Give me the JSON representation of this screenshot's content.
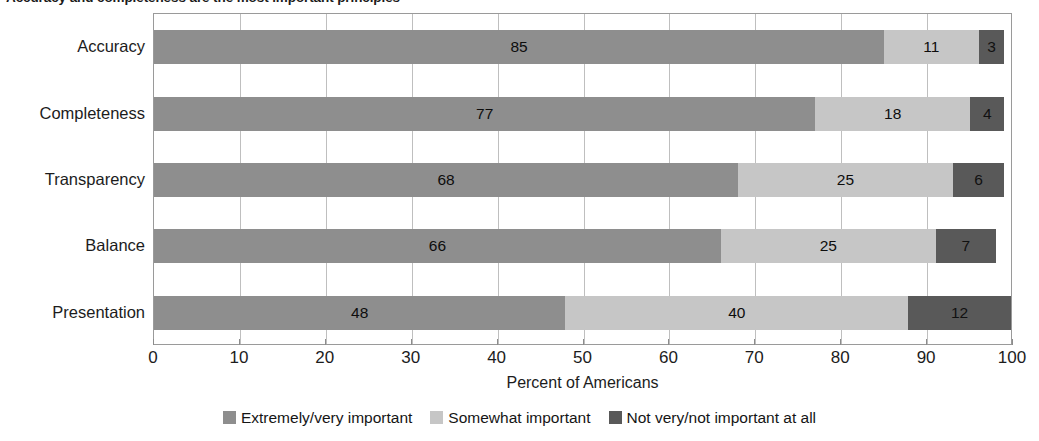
{
  "title": "Accuracy and completeness are the most important principles",
  "chart_data": {
    "type": "bar",
    "orientation": "horizontal",
    "stacked": true,
    "title": "Accuracy and completeness are the most important principles",
    "xlabel": "Percent of Americans",
    "ylabel": "",
    "xlim": [
      0,
      100
    ],
    "xticks": [
      0,
      10,
      20,
      30,
      40,
      50,
      60,
      70,
      80,
      90,
      100
    ],
    "xtick_labels": [
      "0",
      "10",
      "20",
      "30",
      "40",
      "50",
      "60",
      "70",
      "80",
      "90",
      "100"
    ],
    "grid": true,
    "legend_position": "bottom",
    "categories": [
      "Accuracy",
      "Completeness",
      "Transparency",
      "Balance",
      "Presentation"
    ],
    "series": [
      {
        "name": "Extremely/very important",
        "color": "#8e8e8e",
        "values": [
          85,
          77,
          68,
          66,
          48
        ]
      },
      {
        "name": "Somewhat important",
        "color": "#c6c6c6",
        "values": [
          11,
          18,
          25,
          25,
          40
        ]
      },
      {
        "name": "Not very/not important at all",
        "color": "#595959",
        "values": [
          3,
          4,
          6,
          7,
          12
        ]
      }
    ]
  },
  "axis": {
    "x_title": "Percent of Americans"
  },
  "legend": {
    "items": [
      {
        "label": "Extremely/very important",
        "color": "#8e8e8e"
      },
      {
        "label": "Somewhat important",
        "color": "#c6c6c6"
      },
      {
        "label": "Not very/not important at all",
        "color": "#595959"
      }
    ]
  },
  "colors": {
    "series_1": "#8e8e8e",
    "series_2": "#c6c6c6",
    "series_3": "#595959",
    "frame": "#9a9a9a",
    "gridline": "#bfbfbf",
    "text": "#1c1c1c",
    "background": "#ffffff"
  }
}
